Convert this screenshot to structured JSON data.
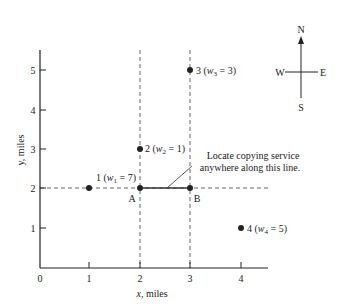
{
  "diagram": {
    "type": "facility-location-grid",
    "axes": {
      "x_label_var": "x",
      "x_label_unit": ", miles",
      "y_label": "y, miles",
      "x_ticks": [
        "0",
        "1",
        "2",
        "3",
        "4"
      ],
      "y_ticks": [
        "1",
        "2",
        "3",
        "4",
        "5"
      ]
    },
    "points": [
      {
        "id": "1",
        "x": 1,
        "y": 2,
        "label_num": "1 (",
        "w_var": "w",
        "w_sub": "1",
        "w_val": " = 7)"
      },
      {
        "id": "2",
        "x": 2,
        "y": 3,
        "label_num": "2 (",
        "w_var": "w",
        "w_sub": "2",
        "w_val": " = 1)"
      },
      {
        "id": "3",
        "x": 3,
        "y": 5,
        "label_num": "3 (",
        "w_var": "w",
        "w_sub": "3",
        "w_val": " = 3)"
      },
      {
        "id": "4",
        "x": 4,
        "y": 1,
        "label_num": "4 (",
        "w_var": "w",
        "w_sub": "4",
        "w_val": " = 5)"
      }
    ],
    "segment": {
      "from_label": "A",
      "to_label": "B",
      "from": [
        2,
        2
      ],
      "to": [
        3,
        2
      ]
    },
    "annotation": {
      "line1": "Locate copying service",
      "line2": "anywhere along this line."
    },
    "compass": {
      "n": "N",
      "s": "S",
      "e": "E",
      "w": "W"
    }
  }
}
